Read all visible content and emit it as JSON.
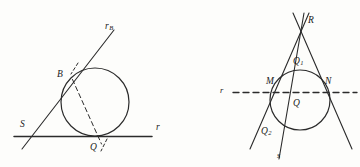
{
  "figure": {
    "background_color": "#fdfdfb",
    "stroke_color": "#2b2b2b",
    "label_color": "#1a1a1a",
    "width": 360,
    "height": 167
  },
  "left_diagram": {
    "name": "tangent-circle-secant-diagram",
    "description": "Circle tangent to line r at Q, secant line r_B through S and tangent point B, dashed chord from B to Q",
    "labels": {
      "line_rb": "r",
      "line_rb_sub": "B",
      "point_b": "B",
      "point_s": "S",
      "point_q": "Q",
      "line_r": "r"
    },
    "geometry": {
      "circle": {
        "cx": 95,
        "cy": 102,
        "r": 34
      },
      "horizontal_line": {
        "x1": 14,
        "y1": 136,
        "x2": 152,
        "y2": 136
      },
      "oblique_line": {
        "x1": 22,
        "y1": 148,
        "x2": 114,
        "y2": 30
      },
      "dashed_chord": {
        "x1": 72,
        "y1": 79,
        "x2": 102,
        "y2": 144
      },
      "tick_upper": {
        "x1": 77,
        "y1": 64,
        "x2": 71,
        "y2": 74
      },
      "tick_lower": {
        "x1": 106,
        "y1": 140,
        "x2": 101,
        "y2": 150
      }
    }
  },
  "right_diagram": {
    "name": "two-tangents-from-external-point-diagram",
    "description": "Circle with two tangent lines from apex R, dashed line r through chord M N, cevian s through Q1 Q Q2",
    "labels": {
      "point_r": "R",
      "point_q1": "Q",
      "point_q1_sub": "1",
      "point_m": "M",
      "point_n": "N",
      "point_q": "Q",
      "point_q2": "Q",
      "point_q2_sub": "2",
      "line_r": "r",
      "line_s": "s"
    },
    "geometry": {
      "circle": {
        "cx": 300,
        "cy": 100,
        "r": 30
      },
      "apex": {
        "x": 301,
        "y": 17
      },
      "tangent_left": {
        "x1": 308,
        "y1": 14,
        "x2": 250,
        "y2": 148
      },
      "tangent_right": {
        "x1": 294,
        "y1": 14,
        "x2": 351,
        "y2": 148
      },
      "cevian_s": {
        "x1": 303,
        "y1": 14,
        "x2": 279,
        "y2": 158
      },
      "dashed_line": {
        "x1": 233,
        "y1": 92,
        "x2": 357,
        "y2": 92
      }
    }
  }
}
